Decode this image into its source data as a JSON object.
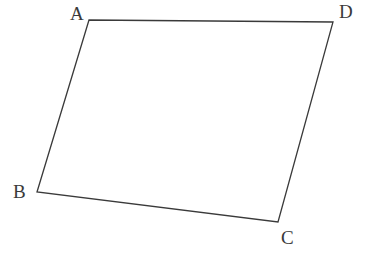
{
  "figure": {
    "type": "quadrilateral",
    "name": "quadrilateral-ABCD",
    "background_color": "#ffffff",
    "stroke_color": "#3a3a3a",
    "stroke_width": 1.3,
    "label_color": "#3a3a3a",
    "canvas": {
      "width": 372,
      "height": 254
    },
    "vertices": [
      {
        "id": "A",
        "label": "A",
        "x": 89,
        "y": 20,
        "label_x": 70,
        "label_y": 4
      },
      {
        "id": "D",
        "label": "D",
        "x": 333,
        "y": 22,
        "label_x": 339,
        "label_y": 2
      },
      {
        "id": "C",
        "label": "C",
        "x": 278,
        "y": 222,
        "label_x": 281,
        "label_y": 228
      },
      {
        "id": "B",
        "label": "B",
        "x": 37,
        "y": 192,
        "label_x": 13,
        "label_y": 182
      }
    ],
    "edges": [
      {
        "id": "AD",
        "from": "A",
        "to": "D"
      },
      {
        "id": "DC",
        "from": "D",
        "to": "C"
      },
      {
        "id": "CB",
        "from": "C",
        "to": "B"
      },
      {
        "id": "BA",
        "from": "B",
        "to": "A"
      }
    ],
    "path": "M 89 20 L 333 22 L 278 222 L 37 192 Z"
  }
}
